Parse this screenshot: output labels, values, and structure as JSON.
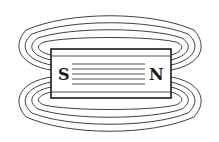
{
  "diagram": {
    "magnet": {
      "south_label": "S",
      "north_label": "N"
    },
    "colors": {
      "line": "#2a2a2a",
      "background": "#ffffff"
    },
    "field_loops_top": 4,
    "field_loops_bottom": 4,
    "internal_lines": 5
  }
}
